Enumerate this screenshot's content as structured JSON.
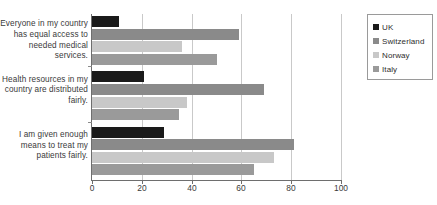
{
  "chart_data": {
    "type": "bar",
    "orientation": "horizontal",
    "title": "",
    "xlabel": "",
    "ylabel": "",
    "xlim": [
      0,
      100
    ],
    "xticks": [
      0,
      20,
      40,
      60,
      80,
      100
    ],
    "grid": true,
    "legend_position": "top-right",
    "categories": [
      "Everyone in my country has equal access to needed medical services.",
      "Health resources in my country are distributed fairly.",
      "I am given enough means to treat my patients fairly."
    ],
    "series": [
      {
        "name": "UK",
        "color": "#1a1a1a",
        "values": [
          11,
          21,
          29
        ]
      },
      {
        "name": "Switzerland",
        "color": "#8a8a8a",
        "values": [
          59,
          69,
          81
        ]
      },
      {
        "name": "Norway",
        "color": "#c8c8c8",
        "values": [
          36,
          38,
          73
        ]
      },
      {
        "name": "Italy",
        "color": "#9a9a9a",
        "values": [
          50,
          35,
          65
        ]
      }
    ]
  }
}
